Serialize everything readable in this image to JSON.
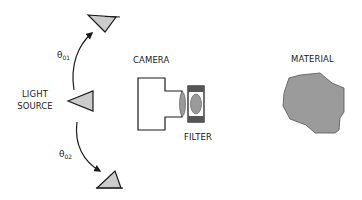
{
  "diagram": {
    "labels": {
      "light_source_line1": "LIGHT",
      "light_source_line2": "SOURCE",
      "camera": "CAMERA",
      "filter": "FILTER",
      "material": "MATERIAL"
    },
    "angles": {
      "upper": {
        "symbol": "θ",
        "subscript": "01"
      },
      "lower": {
        "symbol": "θ",
        "subscript": "02"
      }
    },
    "colors": {
      "stroke": "#1a1a1a",
      "triangle_fill": "#cccccc",
      "lens_fill": "#9a9a9a",
      "filter_frame": "#555555",
      "material_fill": "#9b9b9b",
      "background": "#ffffff"
    },
    "elements": [
      "light-source-upper",
      "light-source-middle",
      "light-source-lower",
      "camera",
      "filter",
      "material"
    ]
  }
}
